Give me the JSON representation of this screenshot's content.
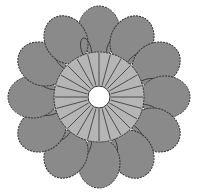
{
  "diagram": {
    "type": "crochet-flower-chart",
    "petal_count": 12,
    "stitch_count": 24,
    "colors": {
      "petal": "#8a8a8a",
      "ring": "#b5b5b5",
      "outline": "#333333",
      "center": "#ffffff"
    }
  }
}
